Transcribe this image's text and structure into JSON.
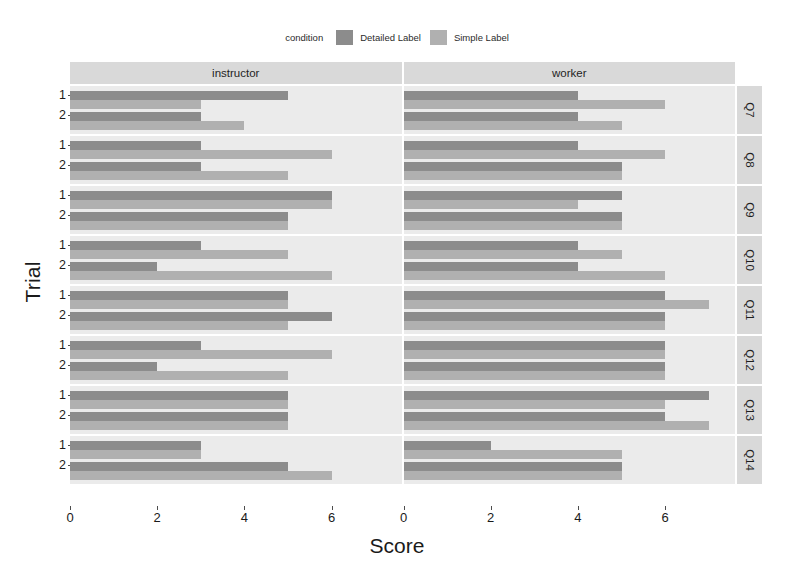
{
  "legend": {
    "title": "condition",
    "items": [
      {
        "label": "Detailed Label",
        "color": "#8c8c8c"
      },
      {
        "label": "Simple Label",
        "color": "#b0b0b0"
      }
    ]
  },
  "axes": {
    "x_title": "Score",
    "y_title": "Trial",
    "x_ticks": [
      "0",
      "2",
      "4",
      "6"
    ],
    "y_ticks": [
      "1",
      "2"
    ]
  },
  "chart_data": {
    "type": "bar",
    "title": "",
    "xlabel": "Score",
    "ylabel": "Trial",
    "xlim": [
      0,
      7.6
    ],
    "grid": false,
    "legend_position": "top",
    "orientation": "horizontal",
    "facet_columns": [
      "instructor",
      "worker"
    ],
    "facet_rows": [
      "Q7",
      "Q8",
      "Q9",
      "Q10",
      "Q11",
      "Q12",
      "Q13",
      "Q14"
    ],
    "categories": [
      "1",
      "2"
    ],
    "series": [
      {
        "name": "Detailed Label",
        "color": "#8c8c8c"
      },
      {
        "name": "Simple Label",
        "color": "#b0b0b0"
      }
    ],
    "panels": [
      {
        "row": "Q7",
        "col": "instructor",
        "trials": [
          {
            "trial": "1",
            "Detailed Label": 5,
            "Simple Label": 3
          },
          {
            "trial": "2",
            "Detailed Label": 3,
            "Simple Label": 4
          }
        ]
      },
      {
        "row": "Q7",
        "col": "worker",
        "trials": [
          {
            "trial": "1",
            "Detailed Label": 4,
            "Simple Label": 6
          },
          {
            "trial": "2",
            "Detailed Label": 4,
            "Simple Label": 5
          }
        ]
      },
      {
        "row": "Q8",
        "col": "instructor",
        "trials": [
          {
            "trial": "1",
            "Detailed Label": 3,
            "Simple Label": 6
          },
          {
            "trial": "2",
            "Detailed Label": 3,
            "Simple Label": 5
          }
        ]
      },
      {
        "row": "Q8",
        "col": "worker",
        "trials": [
          {
            "trial": "1",
            "Detailed Label": 4,
            "Simple Label": 6
          },
          {
            "trial": "2",
            "Detailed Label": 5,
            "Simple Label": 5
          }
        ]
      },
      {
        "row": "Q9",
        "col": "instructor",
        "trials": [
          {
            "trial": "1",
            "Detailed Label": 6,
            "Simple Label": 6
          },
          {
            "trial": "2",
            "Detailed Label": 5,
            "Simple Label": 5
          }
        ]
      },
      {
        "row": "Q9",
        "col": "worker",
        "trials": [
          {
            "trial": "1",
            "Detailed Label": 5,
            "Simple Label": 4
          },
          {
            "trial": "2",
            "Detailed Label": 5,
            "Simple Label": 5
          }
        ]
      },
      {
        "row": "Q10",
        "col": "instructor",
        "trials": [
          {
            "trial": "1",
            "Detailed Label": 3,
            "Simple Label": 5
          },
          {
            "trial": "2",
            "Detailed Label": 2,
            "Simple Label": 6
          }
        ]
      },
      {
        "row": "Q10",
        "col": "worker",
        "trials": [
          {
            "trial": "1",
            "Detailed Label": 4,
            "Simple Label": 5
          },
          {
            "trial": "2",
            "Detailed Label": 4,
            "Simple Label": 6
          }
        ]
      },
      {
        "row": "Q11",
        "col": "instructor",
        "trials": [
          {
            "trial": "1",
            "Detailed Label": 5,
            "Simple Label": 5
          },
          {
            "trial": "2",
            "Detailed Label": 6,
            "Simple Label": 5
          }
        ]
      },
      {
        "row": "Q11",
        "col": "worker",
        "trials": [
          {
            "trial": "1",
            "Detailed Label": 6,
            "Simple Label": 7
          },
          {
            "trial": "2",
            "Detailed Label": 6,
            "Simple Label": 6
          }
        ]
      },
      {
        "row": "Q12",
        "col": "instructor",
        "trials": [
          {
            "trial": "1",
            "Detailed Label": 3,
            "Simple Label": 6
          },
          {
            "trial": "2",
            "Detailed Label": 2,
            "Simple Label": 5
          }
        ]
      },
      {
        "row": "Q12",
        "col": "worker",
        "trials": [
          {
            "trial": "1",
            "Detailed Label": 6,
            "Simple Label": 6
          },
          {
            "trial": "2",
            "Detailed Label": 6,
            "Simple Label": 6
          }
        ]
      },
      {
        "row": "Q13",
        "col": "instructor",
        "trials": [
          {
            "trial": "1",
            "Detailed Label": 5,
            "Simple Label": 5
          },
          {
            "trial": "2",
            "Detailed Label": 5,
            "Simple Label": 5
          }
        ]
      },
      {
        "row": "Q13",
        "col": "worker",
        "trials": [
          {
            "trial": "1",
            "Detailed Label": 7,
            "Simple Label": 6
          },
          {
            "trial": "2",
            "Detailed Label": 6,
            "Simple Label": 7
          }
        ]
      },
      {
        "row": "Q14",
        "col": "instructor",
        "trials": [
          {
            "trial": "1",
            "Detailed Label": 3,
            "Simple Label": 3
          },
          {
            "trial": "2",
            "Detailed Label": 5,
            "Simple Label": 6
          }
        ]
      },
      {
        "row": "Q14",
        "col": "worker",
        "trials": [
          {
            "trial": "1",
            "Detailed Label": 2,
            "Simple Label": 5
          },
          {
            "trial": "2",
            "Detailed Label": 5,
            "Simple Label": 5
          }
        ]
      }
    ]
  }
}
